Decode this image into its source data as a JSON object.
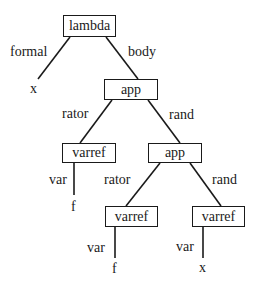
{
  "diagram": {
    "type": "abstract-syntax-tree",
    "nodes": {
      "root": {
        "label": "lambda"
      },
      "body_app": {
        "label": "app"
      },
      "rator_varref": {
        "label": "varref"
      },
      "rand_app": {
        "label": "app"
      },
      "inner_rator_varref": {
        "label": "varref"
      },
      "inner_rand_varref": {
        "label": "varref"
      }
    },
    "edges": {
      "formal": "formal",
      "body": "body",
      "rator1": "rator",
      "rand1": "rand",
      "var1": "var",
      "rator2": "rator",
      "rand2": "rand",
      "var2": "var",
      "var3": "var"
    },
    "leaves": {
      "formal_x": "x",
      "var1_f": "f",
      "var2_f": "f",
      "var3_x": "x"
    }
  }
}
